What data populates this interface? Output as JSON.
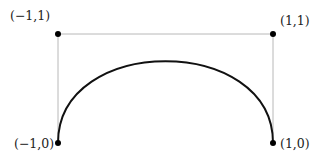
{
  "diagram": {
    "type": "cubic-bezier-control-polygon",
    "curve_color": "#111111",
    "hull_color": "#b8b8b8",
    "points": [
      {
        "id": "p0",
        "x": -1,
        "y": 0,
        "label": "(−1,0)",
        "label_side": "left"
      },
      {
        "id": "p1",
        "x": -1,
        "y": 1,
        "label": "(−1,1)",
        "label_side": "top-left"
      },
      {
        "id": "p2",
        "x": 1,
        "y": 1,
        "label": "(1,1)",
        "label_side": "top-right"
      },
      {
        "id": "p3",
        "x": 1,
        "y": 0,
        "label": "(1,0)",
        "label_side": "right"
      }
    ]
  }
}
